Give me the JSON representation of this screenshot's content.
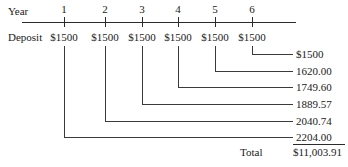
{
  "diagram": {
    "title_row_label": "Year",
    "deposit_row_label": "Deposit",
    "total_label": "Total",
    "total_value": "$11,003.91",
    "axis": {
      "years": [
        "1",
        "2",
        "3",
        "4",
        "5",
        "6"
      ],
      "tick_x": [
        64,
        105,
        142,
        178,
        215,
        252
      ],
      "line_x_start": 22,
      "line_x_end": 296,
      "line_y": 22
    },
    "deposits": [
      {
        "year": "1",
        "amount": "$1500",
        "x": 64
      },
      {
        "year": "2",
        "amount": "$1500",
        "x": 105
      },
      {
        "year": "3",
        "amount": "$1500",
        "x": 142
      },
      {
        "year": "4",
        "amount": "$1500",
        "x": 178
      },
      {
        "year": "5",
        "amount": "$1500",
        "x": 215
      },
      {
        "year": "6",
        "amount": "$1500",
        "x": 252
      }
    ],
    "future_values": [
      {
        "from_year": "6",
        "value": "$1500",
        "x": 252,
        "y": 54
      },
      {
        "from_year": "5",
        "value": "1620.00",
        "x": 215,
        "y": 71
      },
      {
        "from_year": "4",
        "value": "1749.60",
        "x": 178,
        "y": 87
      },
      {
        "from_year": "3",
        "value": "1889.57",
        "x": 142,
        "y": 104
      },
      {
        "from_year": "2",
        "value": "2040.74",
        "x": 105,
        "y": 121
      },
      {
        "from_year": "1",
        "value": "2204.00",
        "x": 64,
        "y": 137
      }
    ],
    "value_label_x": 296,
    "bracket_end_x": 292,
    "colors": {
      "ink": "#1a1a1a",
      "rule": "#2b2b2b",
      "connector": "#3a3a3a",
      "background": "#ffffff"
    }
  }
}
